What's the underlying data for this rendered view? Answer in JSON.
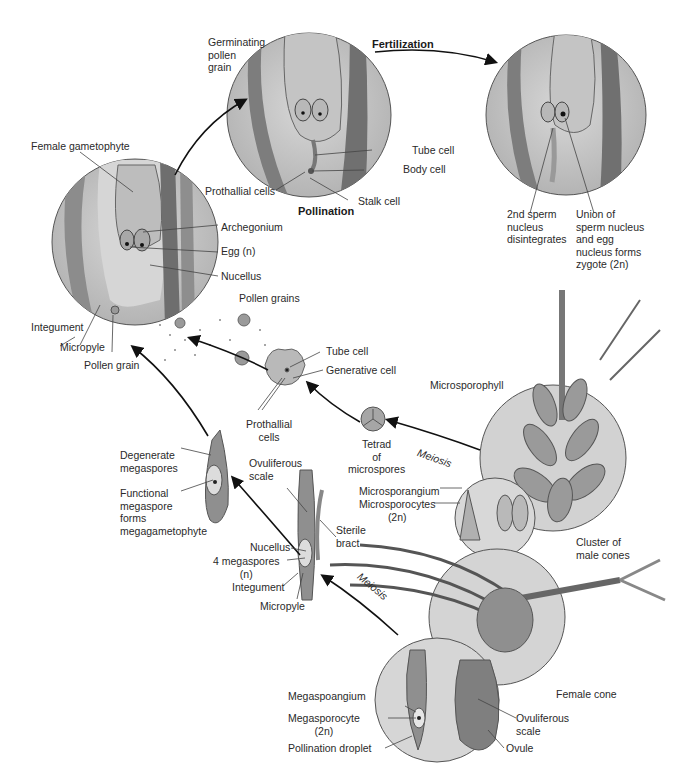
{
  "figure": {
    "stages": {
      "fertilization": "Fertilization",
      "pollination": "Pollination",
      "meiosis_male": "Meiosis",
      "meiosis_female": "Meiosis"
    },
    "labels": {
      "germinating_pollen_grain": "Germinating\npollen\ngrain",
      "female_gametophyte": "Female gametophyte",
      "tube_cell_top": "Tube cell",
      "body_cell": "Body cell",
      "prothallial_cells_top": "Prothallial cells",
      "stalk_cell": "Stalk cell",
      "second_sperm": "2nd sperm\nnucleus\ndisintegrates",
      "union_sperm_egg": "Union of\nsperm nucleus\nand egg\nnucleus forms\nzygote (2n)",
      "archegonium": "Archegonium",
      "egg": "Egg (n)",
      "nucellus_top": "Nucellus",
      "integument_top": "Integument",
      "micropyle_top": "Micropyle",
      "pollen_grain": "Pollen grain",
      "pollen_grains": "Pollen grains",
      "tube_cell_mid": "Tube cell",
      "generative_cell": "Generative cell",
      "prothallial_cells_mid": "Prothallial\ncells",
      "microsporophyll": "Microsporophyll",
      "tetrad": "Tetrad\nof\nmicrospores",
      "degenerate_megaspores": "Degenerate\nmegaspores",
      "functional_megaspore": "Functional\nmegaspore\nforms\nmegagametophyte",
      "ovuliferous_scale_mid": "Ovuliferous\nscale",
      "sterile_bract": "Sterile\nbract",
      "microsporangium": "Microsporangium",
      "microsporocytes": "Microsporocytes\n(2n)",
      "nucellus_mid": "Nucellus",
      "four_megaspores": "4 megaspores\n(n)",
      "integument_mid": "Integument",
      "micropyle_mid": "Micropyle",
      "cluster_male_cones": "Cluster of\nmale cones",
      "female_cone": "Female cone",
      "megasporangium": "Megaspoangium",
      "megasporocyte": "Megasporocyte\n(2n)",
      "pollination_droplet": "Pollination droplet",
      "ovuliferous_scale_bottom": "Ovuliferous\nscale",
      "ovule": "Ovule"
    },
    "colors": {
      "circle_fill": "#c9c9c9",
      "tissue_dark": "#7a7a7a",
      "tissue_mid": "#a8a8a8",
      "tissue_light": "#dcdcdc",
      "line": "#333333",
      "arrow": "#111111"
    }
  }
}
